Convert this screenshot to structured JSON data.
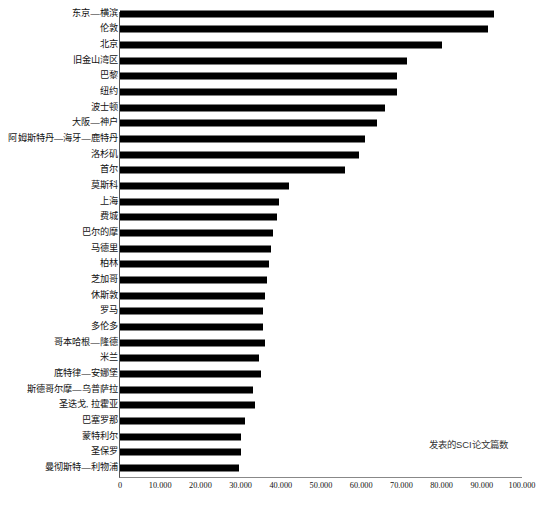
{
  "chart_data": {
    "type": "bar",
    "orientation": "horizontal",
    "title": "",
    "subtitle": "",
    "xlabel": "发表的SCI论文篇数",
    "ylabel": "",
    "xlim": [
      0,
      100000
    ],
    "xticks": [
      0,
      10000,
      20000,
      30000,
      40000,
      50000,
      60000,
      70000,
      80000,
      90000,
      100000
    ],
    "xtick_labels": [
      "0",
      "10.000",
      "20.000",
      "30.000",
      "40.000",
      "50.000",
      "60.000",
      "70.000",
      "80.000",
      "90.000",
      "100.000"
    ],
    "grid": false,
    "legend": null,
    "bar_color": "#000000",
    "annotations": [
      {
        "text": "发表的SCI论文篇数",
        "x": 78000,
        "y": 26
      }
    ],
    "categories": [
      "东京—横滨",
      "伦敦",
      "北京",
      "旧金山湾区",
      "巴黎",
      "纽约",
      "波士顿",
      "大阪—神户",
      "阿姆斯特丹—海牙—鹿特丹",
      "洛杉矶",
      "首尔",
      "莫斯科",
      "上海",
      "费城",
      "巴尔的摩",
      "马德里",
      "柏林",
      "芝加哥",
      "休斯敦",
      "罗马",
      "多伦多",
      "哥本哈根—隆德",
      "米兰",
      "底特律—安娜堡",
      "斯德哥尔摩—乌普萨拉",
      "圣迭戈, 拉霍亚",
      "巴塞罗那",
      "蒙特利尔",
      "圣保罗",
      "曼彻斯特—利物浦"
    ],
    "values": [
      93000,
      91500,
      80000,
      71500,
      69000,
      69000,
      66000,
      64000,
      61000,
      59500,
      56000,
      42000,
      39500,
      39000,
      38000,
      37500,
      37000,
      36500,
      36000,
      35500,
      35500,
      36000,
      34500,
      35000,
      33000,
      33500,
      31000,
      30000,
      30000,
      29500
    ]
  }
}
